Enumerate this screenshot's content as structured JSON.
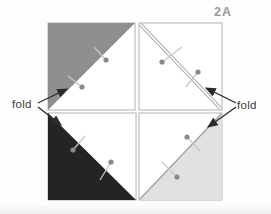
{
  "figure": {
    "label": "2A",
    "fold_label_left": "fold",
    "fold_label_right": "fold"
  },
  "colors": {
    "dark_gray_triangle": "#8f8f8f",
    "black_triangle": "#242424",
    "light_gray_triangle": "#e1e1e1",
    "square_face": "#ffffff",
    "square_border": "#b3b3b3",
    "fold_line": "#a8a8a8",
    "pin_head": "#8a8a8a",
    "pin_stick": "#c6c6c6",
    "arrow": "#2b2b2b",
    "label_text": "#3a3a3a",
    "figure_label_text": "#9a9a9a"
  },
  "squares": [
    {
      "position": "top-left",
      "shaded_half": "upper-left",
      "shade": "medium-gray",
      "pins": 2
    },
    {
      "position": "top-right",
      "shaded_half": "none",
      "fold_line": "diagonal top-left to bottom-right",
      "pins": 2
    },
    {
      "position": "bottom-left",
      "shaded_half": "lower-left",
      "shade": "black",
      "pins": 2
    },
    {
      "position": "bottom-right",
      "shaded_half": "lower-right",
      "shade": "light-gray",
      "pins": 2
    }
  ]
}
